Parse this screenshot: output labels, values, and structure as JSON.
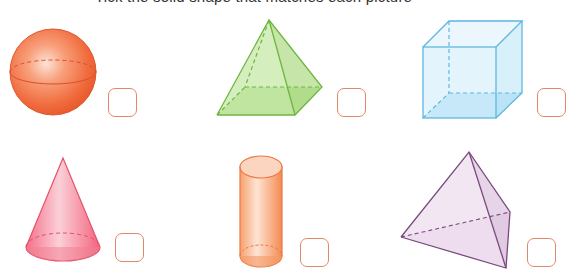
{
  "instruction": {
    "text": "Tick the solid shape that matches each picture",
    "visible": "cut off at top edge"
  },
  "shapes": [
    {
      "id": "sphere",
      "name": "Sphere",
      "color": "#f26a3e",
      "box": {
        "x": 108,
        "y": 88
      }
    },
    {
      "id": "square-pyramid",
      "name": "Square-based pyramid",
      "color": "#8cc85a",
      "box": {
        "x": 337,
        "y": 88
      }
    },
    {
      "id": "cube",
      "name": "Cube",
      "color": "#6cc3e8",
      "box": {
        "x": 537,
        "y": 88
      }
    },
    {
      "id": "cone",
      "name": "Cone",
      "color": "#f2667c",
      "box": {
        "x": 115,
        "y": 233
      }
    },
    {
      "id": "cylinder",
      "name": "Cylinder",
      "color": "#f5925c",
      "box": {
        "x": 300,
        "y": 238
      }
    },
    {
      "id": "tetrahedron",
      "name": "Triangular-based pyramid",
      "color": "#b48aba",
      "box": {
        "x": 527,
        "y": 238
      }
    }
  ],
  "colors": {
    "box_border": "#e2876a",
    "background": "#ffffff"
  }
}
